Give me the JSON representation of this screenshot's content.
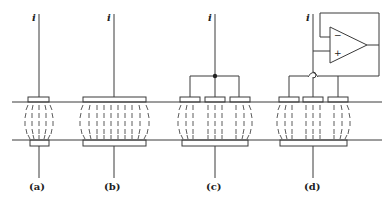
{
  "figure": {
    "current_symbol": "i",
    "panels": [
      {
        "id": "a",
        "label": "(a)",
        "description": "single small electrode pair"
      },
      {
        "id": "b",
        "label": "(b)",
        "description": "single wide electrode pair"
      },
      {
        "id": "c",
        "label": "(c)",
        "description": "three electrodes tied together at common node"
      },
      {
        "id": "d",
        "label": "(d)",
        "description": "guard electrodes driven by voltage follower op-amp"
      }
    ],
    "opamp": {
      "minus_sign": "−",
      "plus_sign": "+"
    },
    "colors": {
      "line": "#3a3a3a",
      "background": "#ffffff"
    }
  }
}
